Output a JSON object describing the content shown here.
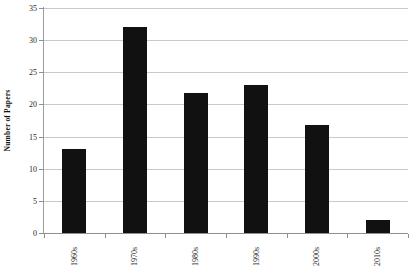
{
  "chart_data": {
    "type": "bar",
    "title": "",
    "subtitle": "",
    "xlabel": "",
    "ylabel": "Number of Papers",
    "categories": [
      "1960s",
      "1970s",
      "1980s",
      "1990s",
      "2000s",
      "2010s"
    ],
    "values": [
      13,
      32,
      21.8,
      23,
      16.8,
      2
    ],
    "series": [
      {
        "name": "Number of Papers",
        "values": [
          13,
          32,
          21.8,
          23,
          16.8,
          2
        ]
      }
    ],
    "ylim": [
      0,
      35
    ],
    "y_ticks": [
      0,
      5,
      10,
      15,
      20,
      25,
      30,
      35
    ],
    "y_tick_labels": [
      "0",
      "5",
      "10",
      "15",
      "20",
      "25",
      "30",
      "35"
    ],
    "grid": "horizontal",
    "legend": "none",
    "legend_position": "none",
    "bar_color": "#111111",
    "gridline_color": "#c9c9c9",
    "axis_color": "#8f8f8f",
    "background_color": "#ffffff",
    "x_tick_label_rotation": "90",
    "y_axis_title_rotation": "90",
    "annotations": []
  }
}
